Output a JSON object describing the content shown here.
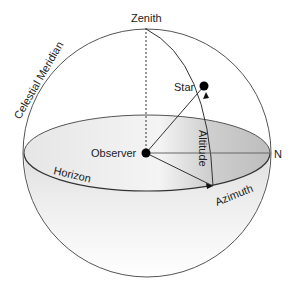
{
  "diagram": {
    "labels": {
      "zenith": "Zenith",
      "celestial_meridian": "Celestial Meridian",
      "star": "Star",
      "observer": "Observer",
      "altitude": "Altitude",
      "horizon": "Horizon",
      "azimuth": "Azimuth",
      "north": "N"
    },
    "colors": {
      "line": "#444444",
      "horizon_fill_light": "#f2f2f2",
      "horizon_fill_dark": "#c8c8c8",
      "point": "#000000"
    }
  }
}
